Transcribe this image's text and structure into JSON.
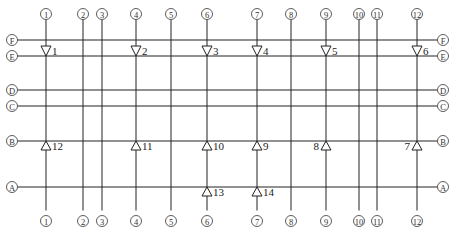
{
  "diagram": {
    "type": "structural-axis-grid",
    "columns": [
      {
        "label": "1",
        "x": 46
      },
      {
        "label": "2",
        "x": 83
      },
      {
        "label": "3",
        "x": 102
      },
      {
        "label": "4",
        "x": 136
      },
      {
        "label": "5",
        "x": 171
      },
      {
        "label": "6",
        "x": 207
      },
      {
        "label": "7",
        "x": 257
      },
      {
        "label": "8",
        "x": 291
      },
      {
        "label": "9",
        "x": 326
      },
      {
        "label": "10",
        "x": 359
      },
      {
        "label": "11",
        "x": 377
      },
      {
        "label": "12",
        "x": 417
      }
    ],
    "rows": [
      {
        "label": "F",
        "y": 40
      },
      {
        "label": "E",
        "y": 56
      },
      {
        "label": "D",
        "y": 90
      },
      {
        "label": "C",
        "y": 106
      },
      {
        "label": "B",
        "y": 141
      },
      {
        "label": "A",
        "y": 187
      }
    ],
    "points": [
      {
        "label": "1",
        "symbol": "triangle-down",
        "column": "1",
        "row": "E",
        "label_side": "right"
      },
      {
        "label": "2",
        "symbol": "triangle-down",
        "column": "4",
        "row": "E",
        "label_side": "right"
      },
      {
        "label": "3",
        "symbol": "triangle-down",
        "column": "6",
        "row": "E",
        "label_side": "right"
      },
      {
        "label": "4",
        "symbol": "triangle-down",
        "column": "7",
        "row": "E",
        "label_side": "right"
      },
      {
        "label": "5",
        "symbol": "triangle-down",
        "column": "9",
        "row": "E",
        "label_side": "right"
      },
      {
        "label": "6",
        "symbol": "triangle-down",
        "column": "12",
        "row": "E",
        "label_side": "right"
      },
      {
        "label": "7",
        "symbol": "triangle-up",
        "column": "12",
        "row": "B",
        "label_side": "left"
      },
      {
        "label": "8",
        "symbol": "triangle-up",
        "column": "9",
        "row": "B",
        "label_side": "left"
      },
      {
        "label": "9",
        "symbol": "triangle-up",
        "column": "7",
        "row": "B",
        "label_side": "right"
      },
      {
        "label": "10",
        "symbol": "triangle-up",
        "column": "6",
        "row": "B",
        "label_side": "right"
      },
      {
        "label": "11",
        "symbol": "triangle-up",
        "column": "4",
        "row": "B",
        "label_side": "right"
      },
      {
        "label": "12",
        "symbol": "triangle-up",
        "column": "1",
        "row": "B",
        "label_side": "right"
      },
      {
        "label": "13",
        "symbol": "triangle-up",
        "column": "6",
        "row": "A",
        "label_side": "right"
      },
      {
        "label": "14",
        "symbol": "triangle-up",
        "column": "7",
        "row": "A",
        "label_side": "right"
      }
    ],
    "colors": {
      "line": "#222222",
      "bubble_stroke": "#333333",
      "background": "#ffffff"
    }
  }
}
